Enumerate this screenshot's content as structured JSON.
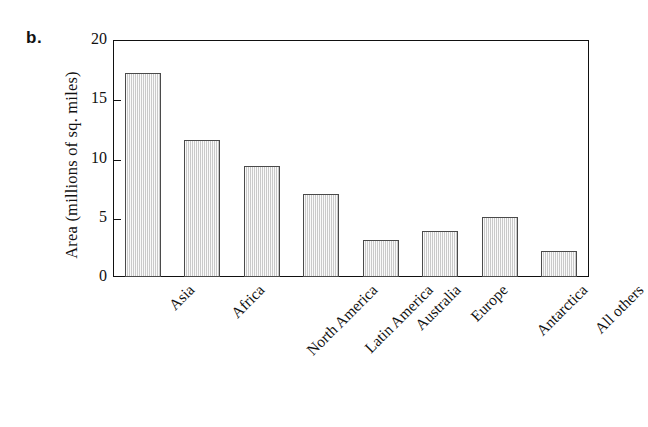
{
  "panel": {
    "label": "b."
  },
  "chart_data": {
    "type": "bar",
    "title": "",
    "subtitle": "",
    "xlabel": "",
    "ylabel": "Area (millions of sq. miles)",
    "categories": [
      "Asia",
      "Africa",
      "North America",
      "Latin America",
      "Australia",
      "Europe",
      "Antarctica",
      "All others"
    ],
    "values": [
      17.2,
      11.6,
      9.4,
      7.0,
      3.1,
      3.9,
      5.1,
      2.2
    ],
    "ylim": [
      0,
      20
    ],
    "ytick_labels": [
      "20",
      "15",
      "10",
      "5",
      "0"
    ],
    "ytick_values": [
      20,
      15,
      10,
      5,
      0
    ],
    "xtick_rotation": -45,
    "grid": false,
    "legend": false,
    "legend_position": "none",
    "bar_fill_color": "#dcdcdc",
    "bar_edge_color": "#4a4a4a",
    "axis_color": "#111111",
    "background_color": "#ffffff"
  }
}
